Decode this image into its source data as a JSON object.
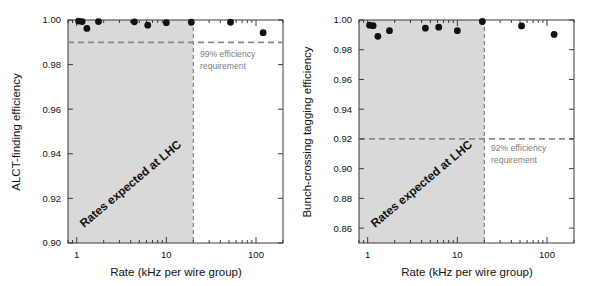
{
  "figure": {
    "name": "ALCT efficiency versus rate (two panels)",
    "background": "#ffffff",
    "panels": [
      "left",
      "right"
    ]
  },
  "colors": {
    "marker": "#111111",
    "axis": "#3a3a3a",
    "shaded_band": "#d9d9d9",
    "dashed_grey": "#8a8a8a",
    "annotation_grey": "#7d7d7d",
    "text": "#111111"
  },
  "chart_data": [
    {
      "id": "alct-finding-efficiency",
      "type": "scatter",
      "title": "",
      "xlabel": "Rate (kHz per wire group)",
      "ylabel": "ALCT-finding  efficiency",
      "xscale": "log",
      "xlim": [
        0.8,
        200
      ],
      "ylim": [
        0.9,
        1.0
      ],
      "xticks": [
        1,
        10,
        100
      ],
      "xtick_labels": [
        "1",
        "10",
        "100"
      ],
      "yticks": [
        0.9,
        0.92,
        0.94,
        0.96,
        0.98,
        1.0
      ],
      "ytick_labels": [
        "0.90",
        "0.92",
        "0.94",
        "0.96",
        "0.98",
        "1.00"
      ],
      "grid": false,
      "legend": "none",
      "x": [
        1.05,
        1.15,
        1.3,
        1.75,
        4.4,
        6.2,
        10.0,
        19.0,
        52.0,
        120.0
      ],
      "y": [
        0.9995,
        0.9993,
        0.9962,
        0.9993,
        0.9992,
        0.9977,
        0.9988,
        0.999,
        0.999,
        0.9943
      ],
      "series": [
        {
          "name": "ALCT-finding efficiency",
          "marker": "filled-circle",
          "values": [
            0.9995,
            0.9993,
            0.9962,
            0.9993,
            0.9992,
            0.9977,
            0.9988,
            0.999,
            0.999,
            0.9943
          ]
        }
      ],
      "hline": {
        "value": 0.99,
        "style": "dashed",
        "label_line1": "99% efficiency",
        "label_line2": "requirement"
      },
      "vline": {
        "value": 20,
        "style": "dashed"
      },
      "shaded_region": {
        "x_from": 0.8,
        "x_to": 20,
        "label": "Rates expected at LHC"
      }
    },
    {
      "id": "bunch-crossing-tagging-efficiency",
      "type": "scatter",
      "title": "",
      "xlabel": "Rate (kHz per wire group)",
      "ylabel": "Bunch-crossing tagging efficiency",
      "xscale": "log",
      "xlim": [
        0.8,
        200
      ],
      "ylim": [
        0.85,
        1.0
      ],
      "xticks": [
        1,
        10,
        100
      ],
      "xtick_labels": [
        "1",
        "10",
        "100"
      ],
      "yticks": [
        0.86,
        0.88,
        0.9,
        0.92,
        0.94,
        0.96,
        0.98,
        1.0
      ],
      "ytick_labels": [
        "0.86",
        "0.88",
        "0.90",
        "0.92",
        "0.94",
        "0.96",
        "0.98",
        "1.00"
      ],
      "grid": false,
      "legend": "none",
      "x": [
        1.05,
        1.15,
        1.3,
        1.75,
        4.4,
        6.2,
        10.0,
        19.0,
        52.0,
        120.0
      ],
      "y": [
        0.9965,
        0.9962,
        0.989,
        0.9928,
        0.9945,
        0.9952,
        0.9928,
        0.999,
        0.996,
        0.9903
      ],
      "series": [
        {
          "name": "Bunch-crossing tagging efficiency",
          "marker": "filled-circle",
          "values": [
            0.9965,
            0.9962,
            0.989,
            0.9928,
            0.9945,
            0.9952,
            0.9928,
            0.999,
            0.996,
            0.9903
          ]
        }
      ],
      "hline": {
        "value": 0.92,
        "style": "dashed",
        "label_line1": "92% efficiency",
        "label_line2": "requirement"
      },
      "vline": {
        "value": 20,
        "style": "dashed"
      },
      "shaded_region": {
        "x_from": 0.8,
        "x_to": 20,
        "label": "Rates expected at LHC"
      }
    }
  ]
}
